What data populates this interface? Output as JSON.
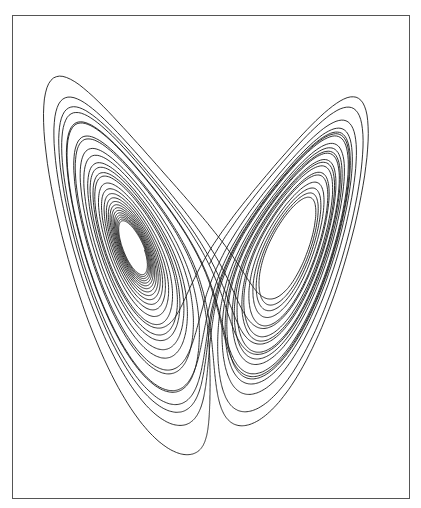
{
  "caption": "",
  "chart_data": {
    "type": "line",
    "title": "",
    "xlabel": "",
    "ylabel": "",
    "grid": false,
    "legend": null,
    "system": {
      "name": "Lorenz",
      "sigma": 10,
      "rho": 28,
      "beta": 2.6667,
      "initial": [
        1.0,
        1.0,
        1.0
      ],
      "dt": 0.004,
      "steps": 9000,
      "skip": 600
    },
    "projection": {
      "horizontal": "x",
      "vertical": "z",
      "xlim": [
        -21,
        21
      ],
      "zlim": [
        1,
        51
      ]
    },
    "line_color": "#1a1a1a",
    "line_width": 0.9
  },
  "frame": {
    "left": 12,
    "top": 15,
    "width": 398,
    "height": 484,
    "border_color": "#555555"
  }
}
